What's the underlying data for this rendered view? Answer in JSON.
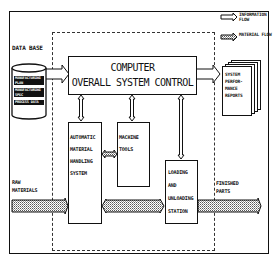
{
  "legend": {
    "information_flow": "INFORMATION FLOW",
    "material_flow": "MATERIAL FLOW"
  },
  "database": {
    "title": "DATA BASE",
    "items": [
      "MANUFACTURING PLAN",
      "MANUFACTURING SPEC",
      "PROCESS DATA"
    ]
  },
  "computer": {
    "line1": "COMPUTER",
    "line2": "OVERALL SYSTEM CONTROL"
  },
  "reports": {
    "lines": [
      "SYSTEM",
      "PERFOR-",
      "MANCE",
      "REPORTS"
    ]
  },
  "amhs": {
    "lines": [
      "AUTOMATIC",
      "MATERIAL",
      "HANDLING",
      "SYSTEM"
    ]
  },
  "machine_tools": {
    "lines": [
      "MACHINE",
      "TOOLS"
    ]
  },
  "loading_station": {
    "lines": [
      "LOADING",
      "AND",
      "UNLOADING",
      "STATION"
    ]
  },
  "raw_materials": {
    "lines": [
      "RAW",
      "MATERIALS"
    ]
  },
  "finished_parts": {
    "lines": [
      "FINISHED",
      "PARTS"
    ]
  }
}
